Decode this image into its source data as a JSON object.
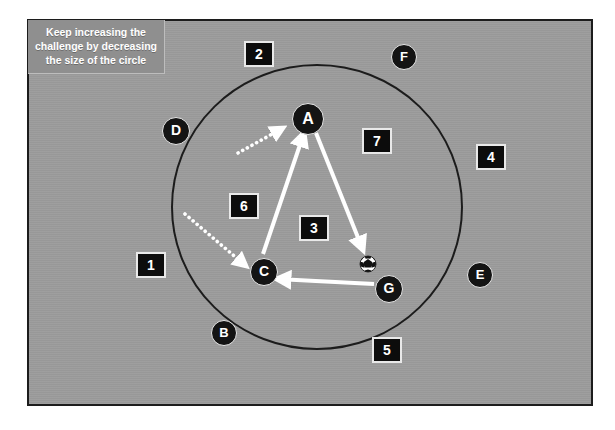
{
  "diagram": {
    "field": {
      "background_color": "#9b9b9b",
      "border_color": "#1c1c1c"
    },
    "circle": {
      "label": "training-circle",
      "stroke_color": "#1c1c1c",
      "center_x": 317,
      "center_y": 207,
      "radius_x": 145,
      "radius_y": 142
    },
    "callout": {
      "text": "Keep increasing the challenge by decreasing the size of the circle",
      "background_color": "#8f8f8f",
      "text_color": "#ffffff"
    },
    "cones": [
      {
        "label": "1",
        "x": 136,
        "y": 252
      },
      {
        "label": "2",
        "x": 244,
        "y": 41
      },
      {
        "label": "3",
        "x": 299,
        "y": 215
      },
      {
        "label": "4",
        "x": 476,
        "y": 144
      },
      {
        "label": "5",
        "x": 372,
        "y": 337
      },
      {
        "label": "6",
        "x": 229,
        "y": 193
      },
      {
        "label": "7",
        "x": 362,
        "y": 128
      }
    ],
    "players": [
      {
        "label": "A",
        "x": 292,
        "y": 103,
        "size": "lg",
        "inside_circle": true
      },
      {
        "label": "B",
        "x": 211,
        "y": 320,
        "size": "sm",
        "inside_circle": false
      },
      {
        "label": "C",
        "x": 250,
        "y": 258,
        "size": "md",
        "inside_circle": true
      },
      {
        "label": "D",
        "x": 162,
        "y": 117,
        "size": "md",
        "inside_circle": false
      },
      {
        "label": "E",
        "x": 467,
        "y": 262,
        "size": "sm",
        "inside_circle": false
      },
      {
        "label": "F",
        "x": 391,
        "y": 44,
        "size": "sm",
        "inside_circle": false
      },
      {
        "label": "G",
        "x": 375,
        "y": 275,
        "size": "md",
        "inside_circle": true
      }
    ],
    "ball": {
      "label": "soccer-ball",
      "x": 368,
      "y": 264,
      "radius": 8
    },
    "pass_arrows": [
      {
        "name": "pass-c-to-a",
        "from": "C",
        "to": "A",
        "style": "solid",
        "color": "#ffffff",
        "x1": 263,
        "y1": 254,
        "x2": 304,
        "y2": 133
      },
      {
        "name": "pass-a-to-ball",
        "from": "A",
        "to": "ball",
        "style": "solid",
        "color": "#ffffff",
        "x1": 316,
        "y1": 133,
        "x2": 363,
        "y2": 250
      },
      {
        "name": "pass-g-to-c",
        "from": "G",
        "to": "C",
        "style": "solid",
        "color": "#ffffff",
        "x1": 374,
        "y1": 284,
        "x2": 277,
        "y2": 279
      }
    ],
    "run_arrows": [
      {
        "name": "run-toward-a",
        "style": "dotted",
        "color": "#ffffff",
        "x1": 238,
        "y1": 153,
        "x2": 283,
        "y2": 128
      },
      {
        "name": "run-toward-c",
        "style": "dotted",
        "color": "#ffffff",
        "x1": 185,
        "y1": 214,
        "x2": 246,
        "y2": 266
      }
    ]
  }
}
